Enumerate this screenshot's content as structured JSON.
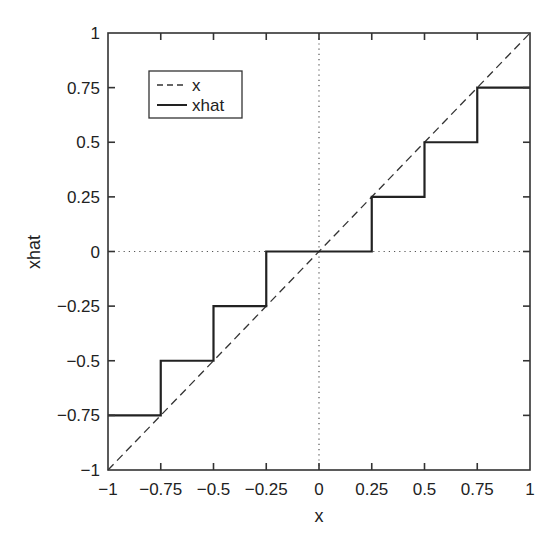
{
  "chart_data": {
    "type": "line",
    "title": "",
    "xlabel": "x",
    "ylabel": "xhat",
    "xlim": [
      -1,
      1
    ],
    "ylim": [
      -1,
      1
    ],
    "grid": false,
    "zero_lines": {
      "style": "dotted",
      "x": 0,
      "y": 0
    },
    "x_ticks": [
      -1,
      -0.75,
      -0.5,
      -0.25,
      0,
      0.25,
      0.5,
      0.75,
      1
    ],
    "x_tick_labels": [
      "−1",
      "−0.75",
      "−0.5",
      "−0.25",
      "0",
      "0.25",
      "0.5",
      "0.75",
      "1"
    ],
    "y_ticks": [
      -1,
      -0.75,
      -0.5,
      -0.25,
      0,
      0.25,
      0.5,
      0.75,
      1
    ],
    "y_tick_labels": [
      "−1",
      "−0.75",
      "−0.5",
      "−0.25",
      "0",
      "0.25",
      "0.5",
      "0.75",
      "1"
    ],
    "legend": {
      "position": "upper-left",
      "entries": [
        {
          "label": "x",
          "style": "dashed"
        },
        {
          "label": "xhat",
          "style": "solid"
        }
      ]
    },
    "series": [
      {
        "name": "x",
        "style": "dashed",
        "x": [
          -1,
          1
        ],
        "y": [
          -1,
          1
        ]
      },
      {
        "name": "xhat",
        "style": "solid",
        "x": [
          -1,
          -0.75,
          -0.75,
          -0.5,
          -0.5,
          -0.25,
          -0.25,
          0.25,
          0.25,
          0.5,
          0.5,
          0.75,
          0.75,
          1
        ],
        "y": [
          -0.75,
          -0.75,
          -0.5,
          -0.5,
          -0.25,
          -0.25,
          0,
          0,
          0.25,
          0.25,
          0.5,
          0.5,
          0.75,
          0.75
        ]
      }
    ]
  },
  "colors": {
    "axis": "#333333",
    "line": "#222222",
    "dotted": "#555555",
    "background": "#ffffff"
  }
}
